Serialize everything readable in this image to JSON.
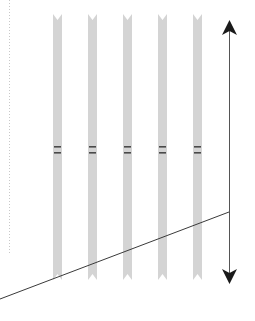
{
  "diagram": {
    "title": "",
    "canvas": {
      "width": 255,
      "height": 321,
      "background": "#ffffff"
    },
    "colors": {
      "strip_fill": "#d4d4d4",
      "band_color": "#4a4a4a",
      "arrow_color": "#1a1a1a",
      "line_color": "#3a3a3a",
      "dotted_color": "#c8c8c8"
    },
    "dotted_guide": {
      "x": 9,
      "y1": 0,
      "y2": 255
    },
    "strips": [
      {
        "id": "strip-1",
        "x": 53,
        "width": 9,
        "top": 18,
        "bottom": 280,
        "bands": [
          147,
          153
        ]
      },
      {
        "id": "strip-2",
        "x": 88,
        "width": 9,
        "top": 18,
        "bottom": 280,
        "bands": [
          147,
          153
        ]
      },
      {
        "id": "strip-3",
        "x": 123,
        "width": 9,
        "top": 18,
        "bottom": 280,
        "bands": [
          147,
          153
        ]
      },
      {
        "id": "strip-4",
        "x": 158,
        "width": 9,
        "top": 18,
        "bottom": 280,
        "bands": [
          147,
          153
        ]
      },
      {
        "id": "strip-5",
        "x": 193,
        "width": 9,
        "top": 18,
        "bottom": 280,
        "bands": [
          147,
          153
        ]
      }
    ],
    "double_arrow": {
      "x": 229,
      "y1": 22,
      "y2": 282,
      "icon_top": "arrow-up-icon",
      "icon_bottom": "arrow-down-icon"
    },
    "diagonal_line": {
      "x1": 0,
      "y1": 299,
      "x2": 229,
      "y2": 212
    }
  }
}
